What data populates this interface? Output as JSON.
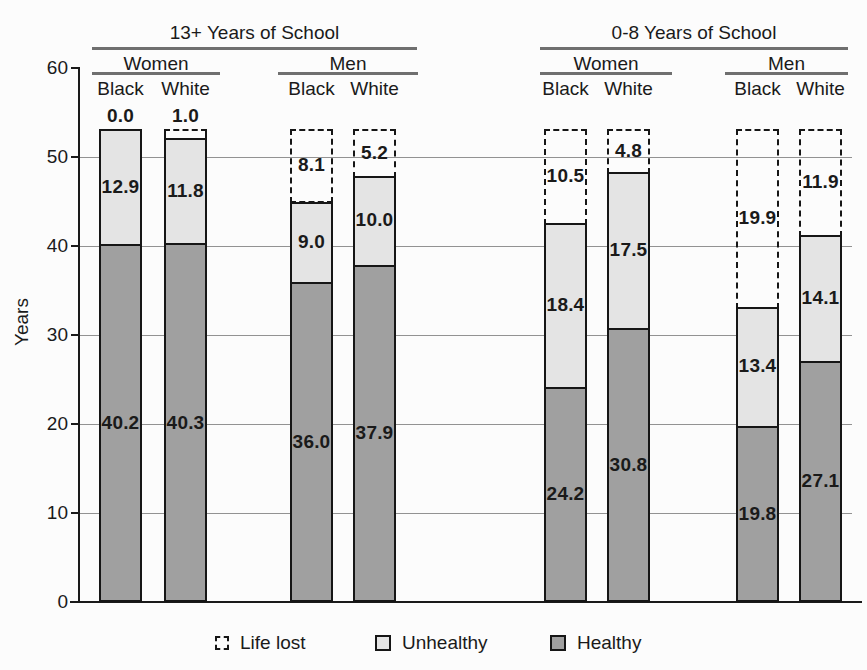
{
  "chart_data": {
    "type": "bar",
    "stacked": true,
    "title": "",
    "ylabel": "Years",
    "ylim": [
      0,
      60
    ],
    "yticks": [
      0,
      10,
      20,
      30,
      40,
      50,
      60
    ],
    "gridlines": [
      10,
      20,
      30,
      40,
      50
    ],
    "grid": true,
    "legend_position": "bottom",
    "total_per_bar": 53.1,
    "groups": [
      {
        "label": "13+ Years of School",
        "subgroups": [
          {
            "label": "Women",
            "bars": [
              {
                "label": "Black",
                "healthy": 40.2,
                "unhealthy": 12.9,
                "life_lost": 0.0
              },
              {
                "label": "White",
                "healthy": 40.3,
                "unhealthy": 11.8,
                "life_lost": 1.0
              }
            ]
          },
          {
            "label": "Men",
            "bars": [
              {
                "label": "Black",
                "healthy": 36.0,
                "unhealthy": 9.0,
                "life_lost": 8.1
              },
              {
                "label": "White",
                "healthy": 37.9,
                "unhealthy": 10.0,
                "life_lost": 5.2
              }
            ]
          }
        ]
      },
      {
        "label": "0-8 Years of School",
        "subgroups": [
          {
            "label": "Women",
            "bars": [
              {
                "label": "Black",
                "healthy": 24.2,
                "unhealthy": 18.4,
                "life_lost": 10.5
              },
              {
                "label": "White",
                "healthy": 30.8,
                "unhealthy": 17.5,
                "life_lost": 4.8
              }
            ]
          },
          {
            "label": "Men",
            "bars": [
              {
                "label": "Black",
                "healthy": 19.8,
                "unhealthy": 13.4,
                "life_lost": 19.9
              },
              {
                "label": "White",
                "healthy": 27.1,
                "unhealthy": 14.1,
                "life_lost": 11.9
              }
            ]
          }
        ]
      }
    ],
    "legend": [
      {
        "label": "Life lost",
        "style": "dashed"
      },
      {
        "label": "Unhealthy",
        "style": "light"
      },
      {
        "label": "Healthy",
        "style": "dark"
      }
    ],
    "colors": {
      "healthy": "#a0a0a0",
      "unhealthy": "#e4e4e4",
      "life_lost_border": "#161616",
      "axis": "#1a1a1a",
      "grid": "#929292",
      "header_rule": "#6f6f6f"
    }
  }
}
